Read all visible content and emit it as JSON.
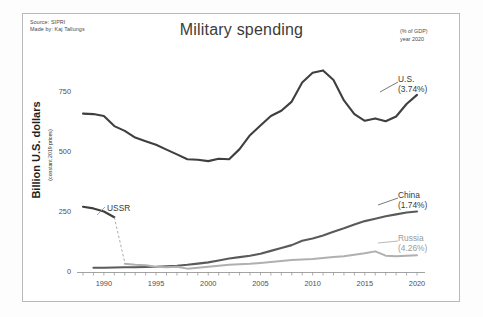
{
  "figure": {
    "title": "Military spending",
    "source_line1": "Source: SIPRI",
    "source_line2": "Made by: Kaj Tallungs",
    "note_line1": "(% of GDP)",
    "note_line2": "year 2020",
    "y_axis_title": "Billion U.S. dollars",
    "y_axis_subtitle": "(constant 2019 prices)"
  },
  "labels": {
    "us_name": "U.S.",
    "us_pct": "(3.74%)",
    "china_name": "China",
    "china_pct": "(1.74%)",
    "russia_name": "Russia",
    "russia_pct": "(4.26%)",
    "ussr_name": "USSR"
  },
  "colors": {
    "us": "#3f3f3f",
    "china": "#5a5a5a",
    "russia": "#b0b0b0",
    "ussr": "#3f3f3f",
    "axis": "#8c8c8c",
    "frame": "#b9b9b9",
    "text": "#4a4a4a"
  },
  "chart_data": {
    "type": "line",
    "title": "Military spending",
    "xlabel": "",
    "ylabel": "Billion U.S. dollars (constant 2019 prices)",
    "xlim": [
      1988,
      2020
    ],
    "ylim": [
      0,
      900
    ],
    "xticks": [
      1990,
      1995,
      2000,
      2005,
      2010,
      2015,
      2020
    ],
    "yticks": [
      0,
      250,
      500,
      750
    ],
    "grid": false,
    "legend": "right-annotations",
    "annotations": [
      {
        "text": "USSR",
        "x": 1991.2,
        "y": 215
      },
      {
        "text": "(% of GDP) year 2020",
        "x": 2020,
        "y": 880
      }
    ],
    "series": [
      {
        "name": "U.S.",
        "gdp_pct": 3.74,
        "color": "#3f3f3f",
        "x": [
          1988,
          1989,
          1990,
          1991,
          1992,
          1993,
          1994,
          1995,
          1996,
          1997,
          1998,
          1999,
          2000,
          2001,
          2002,
          2003,
          2004,
          2005,
          2006,
          2007,
          2008,
          2009,
          2010,
          2011,
          2012,
          2013,
          2014,
          2015,
          2016,
          2017,
          2018,
          2019,
          2020
        ],
        "y": [
          660,
          658,
          650,
          608,
          588,
          560,
          545,
          530,
          510,
          490,
          470,
          468,
          462,
          472,
          470,
          512,
          570,
          610,
          650,
          672,
          710,
          790,
          830,
          840,
          800,
          715,
          658,
          630,
          640,
          628,
          648,
          700,
          738
        ]
      },
      {
        "name": "China",
        "gdp_pct": 1.74,
        "color": "#5a5a5a",
        "x": [
          1989,
          1990,
          1991,
          1992,
          1993,
          1994,
          1995,
          1996,
          1997,
          1998,
          1999,
          2000,
          2001,
          2002,
          2003,
          2004,
          2005,
          2006,
          2007,
          2008,
          2009,
          2010,
          2011,
          2012,
          2013,
          2014,
          2015,
          2016,
          2017,
          2018,
          2019,
          2020
        ],
        "y": [
          18,
          18,
          19,
          20,
          20,
          21,
          22,
          24,
          26,
          30,
          35,
          40,
          48,
          56,
          62,
          68,
          76,
          88,
          100,
          112,
          130,
          140,
          152,
          168,
          182,
          198,
          212,
          222,
          232,
          240,
          248,
          252
        ]
      },
      {
        "name": "Russia",
        "gdp_pct": 4.26,
        "color": "#b0b0b0",
        "x": [
          1992,
          1993,
          1994,
          1995,
          1996,
          1997,
          1998,
          1999,
          2000,
          2001,
          2002,
          2003,
          2004,
          2005,
          2006,
          2007,
          2008,
          2009,
          2010,
          2011,
          2012,
          2013,
          2014,
          2015,
          2016,
          2017,
          2018,
          2019,
          2020
        ],
        "y": [
          34,
          30,
          28,
          22,
          20,
          22,
          14,
          18,
          22,
          26,
          30,
          32,
          34,
          38,
          42,
          46,
          50,
          52,
          54,
          58,
          62,
          66,
          72,
          78,
          86,
          68,
          66,
          68,
          70
        ]
      },
      {
        "name": "USSR",
        "gdp_pct": null,
        "color": "#3f3f3f",
        "solid_x": [
          1988,
          1989,
          1990,
          1991
        ],
        "solid_y": [
          272,
          265,
          252,
          228
        ],
        "dashed_x": [
          1991,
          1992
        ],
        "dashed_y": [
          228,
          40
        ]
      }
    ]
  }
}
